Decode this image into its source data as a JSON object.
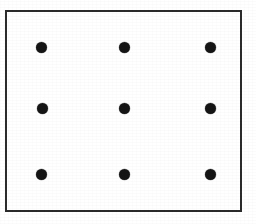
{
  "figure": {
    "description": "A plain rectangular frame enclosing a three-by-three grid of nine solid black dots.",
    "background_color": "#ffffff",
    "frame": {
      "name": "rectangular border",
      "stroke_color": "#2b2b2b",
      "stroke_width_px": 2,
      "fill_color": "#ffffff",
      "left_px": 5,
      "top_px": 10,
      "width_px": 237,
      "height_px": 202
    },
    "dot_style": {
      "color": "#151515",
      "shape": "circle",
      "diameter_px": 11
    },
    "grid": {
      "rows": 3,
      "columns": 3,
      "total_dots": 9,
      "column_centers_px": [
        41,
        124,
        210
      ],
      "row_centers_px": [
        47,
        108,
        174
      ]
    },
    "dots": [
      {
        "id": "dot-r1c1",
        "row": 1,
        "col": 1,
        "cx": 41,
        "cy": 47
      },
      {
        "id": "dot-r1c2",
        "row": 1,
        "col": 2,
        "cx": 124,
        "cy": 47
      },
      {
        "id": "dot-r1c3",
        "row": 1,
        "col": 3,
        "cx": 210,
        "cy": 47
      },
      {
        "id": "dot-r2c1",
        "row": 2,
        "col": 1,
        "cx": 42,
        "cy": 108
      },
      {
        "id": "dot-r2c2",
        "row": 2,
        "col": 2,
        "cx": 124,
        "cy": 108
      },
      {
        "id": "dot-r2c3",
        "row": 2,
        "col": 3,
        "cx": 210,
        "cy": 108
      },
      {
        "id": "dot-r3c1",
        "row": 3,
        "col": 1,
        "cx": 41,
        "cy": 174
      },
      {
        "id": "dot-r3c2",
        "row": 3,
        "col": 2,
        "cx": 124,
        "cy": 174
      },
      {
        "id": "dot-r3c3",
        "row": 3,
        "col": 3,
        "cx": 210,
        "cy": 174
      }
    ]
  }
}
